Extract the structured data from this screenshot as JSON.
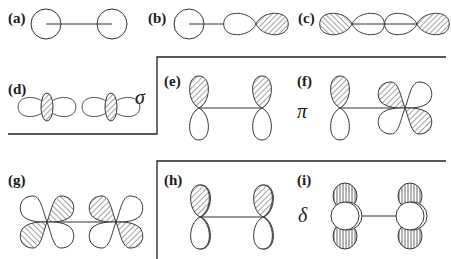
{
  "figure": {
    "colors": {
      "stroke": "#333333",
      "hatch": "#555555",
      "background": "#ffffff",
      "divider": "#222222"
    },
    "groups": [
      {
        "bond_type": "sigma",
        "symbol": "σ",
        "panels": [
          "a",
          "b",
          "c",
          "d"
        ]
      },
      {
        "bond_type": "pi",
        "symbol": "π",
        "panels": [
          "e",
          "f",
          "g"
        ]
      },
      {
        "bond_type": "delta",
        "symbol": "δ",
        "panels": [
          "h",
          "i"
        ]
      }
    ],
    "panels": [
      {
        "id": "a",
        "label": "(a)",
        "orbitals": [
          "s",
          "s"
        ]
      },
      {
        "id": "b",
        "label": "(b)",
        "orbitals": [
          "s",
          "p"
        ]
      },
      {
        "id": "c",
        "label": "(c)",
        "orbitals": [
          "p",
          "p"
        ]
      },
      {
        "id": "d",
        "label": "(d)",
        "orbitals": [
          "d",
          "d"
        ]
      },
      {
        "id": "e",
        "label": "(e)",
        "orbitals": [
          "p",
          "p"
        ]
      },
      {
        "id": "f",
        "label": "(f)",
        "orbitals": [
          "p",
          "d"
        ]
      },
      {
        "id": "g",
        "label": "(g)",
        "orbitals": [
          "d",
          "d"
        ]
      },
      {
        "id": "h",
        "label": "(h)",
        "orbitals": [
          "d",
          "d"
        ]
      },
      {
        "id": "i",
        "label": "(i)",
        "orbitals": [
          "d",
          "d"
        ]
      }
    ],
    "symbols": {
      "sigma": "σ",
      "pi": "π",
      "delta": "δ"
    }
  }
}
